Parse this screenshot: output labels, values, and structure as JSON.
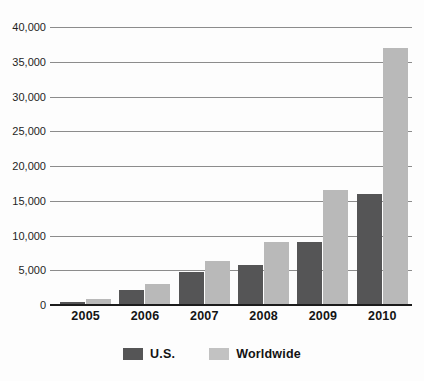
{
  "chart_data": {
    "type": "bar",
    "title": "",
    "subtitle": "",
    "xlabel": "",
    "ylabel": "",
    "categories": [
      "2005",
      "2006",
      "2007",
      "2008",
      "2009",
      "2010"
    ],
    "series": [
      {
        "name": "U.S.",
        "color": "#555556",
        "values": [
          400,
          2100,
          4700,
          5700,
          9000,
          16000
        ]
      },
      {
        "name": "Worldwide",
        "color": "#b9b9b9",
        "values": [
          900,
          3000,
          6400,
          9000,
          16500,
          37000
        ]
      }
    ],
    "ylim": [
      0,
      40000
    ],
    "ytick_values": [
      0,
      5000,
      10000,
      15000,
      20000,
      25000,
      30000,
      35000,
      40000
    ],
    "ytick_labels": [
      "0",
      "5,000",
      "10,000",
      "15,000",
      "20,000",
      "25,000",
      "30,000",
      "35,000",
      "40,000"
    ],
    "grid": true,
    "grid_color": "#8c8c8c",
    "legend_position": "bottom",
    "background": "#fdfdfd"
  },
  "legend": {
    "items": [
      {
        "label": "U.S.",
        "swatch": "legend-swatch-us"
      },
      {
        "label": "Worldwide",
        "swatch": "legend-swatch-worldwide"
      }
    ]
  }
}
